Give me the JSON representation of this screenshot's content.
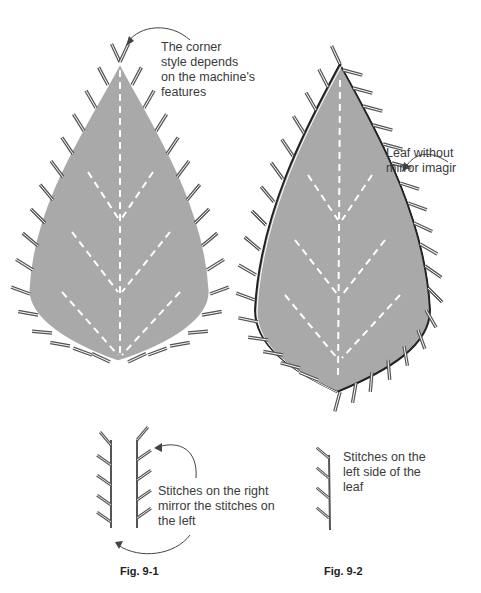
{
  "figures": {
    "fig1": {
      "caption": "Fig. 9-1",
      "annotation_top": "The corner\nstyle depends\non the machine's\nfeatures",
      "annotation_bottom": "Stitches on the right\nmirror the stitches on\nthe left"
    },
    "fig2": {
      "caption": "Fig. 9-2",
      "annotation_top": "Leaf without\nmirror imagir",
      "annotation_bottom": "Stitches on the\nleft side of the\nleaf"
    }
  },
  "colors": {
    "leaf_fill": "#a9a9a9",
    "stitch": "#555555",
    "vein": "#ffffff",
    "outline": "#222222"
  }
}
